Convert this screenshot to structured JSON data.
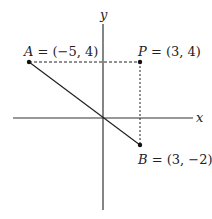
{
  "diagram": {
    "axes": {
      "x_label": "x",
      "y_label": "y"
    },
    "points": [
      {
        "name": "A",
        "coords": "(−5, 4)",
        "label": "A",
        "value": " = (−5, 4)"
      },
      {
        "name": "P",
        "coords": "(3, 4)",
        "label": "P",
        "value": " = (3, 4)"
      },
      {
        "name": "B",
        "coords": "(3, −2)",
        "label": "B",
        "value": " = (3, −2)"
      }
    ],
    "segments": [
      {
        "from": "A",
        "to": "B",
        "style": "solid"
      },
      {
        "from": "A",
        "to": "P",
        "style": "dashed"
      },
      {
        "from": "P",
        "to": "B",
        "style": "dashed"
      }
    ],
    "colors": {
      "line": "#222222",
      "axis": "#333333",
      "background": "#ffffff"
    }
  }
}
